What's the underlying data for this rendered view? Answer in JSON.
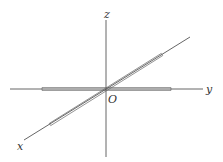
{
  "diagram": {
    "labels": {
      "z": "z",
      "y": "y",
      "x": "x",
      "origin": "O"
    },
    "colors": {
      "line": "#444444",
      "label": "#333333",
      "background": "#ffffff"
    }
  }
}
